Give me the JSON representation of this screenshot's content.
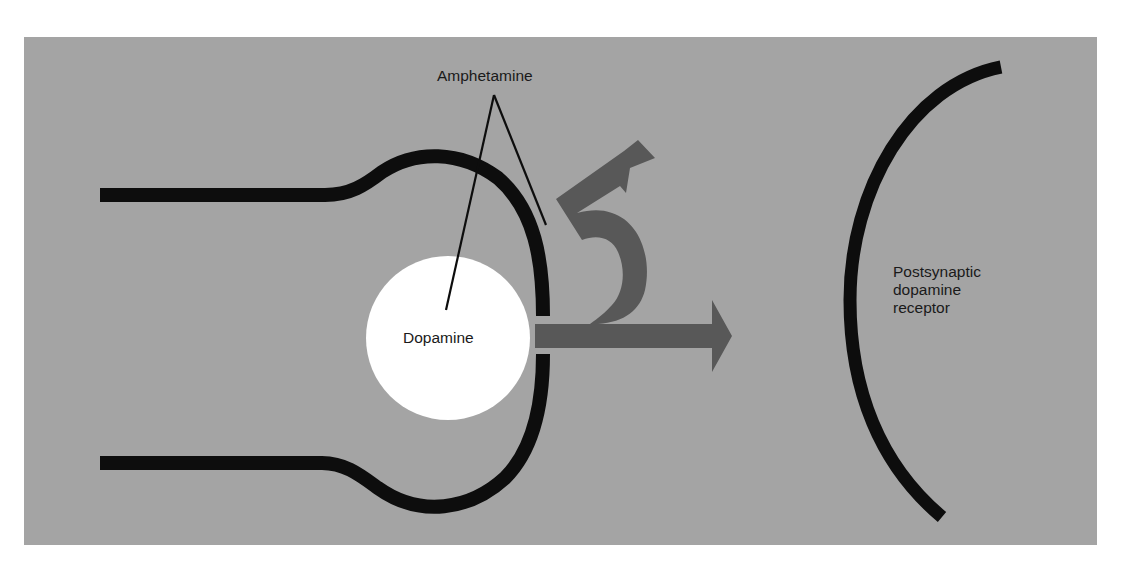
{
  "diagram": {
    "type": "synapse-schematic",
    "colors": {
      "background": "#a4a4a4",
      "membrane": "#0d0d0d",
      "arrow": "#585858",
      "vesicle": "#ffffff",
      "text": "#1a1a1a"
    },
    "labels": {
      "amphetamine": "Amphetamine",
      "dopamine": "Dopamine",
      "receptor": "Postsynaptic\ndopamine\nreceptor"
    },
    "elements": [
      {
        "id": "presynaptic-terminal",
        "description": "Bulb-shaped presynaptic terminal outline with a gap on its right side"
      },
      {
        "id": "dopamine-vesicle",
        "description": "White circle labeled Dopamine"
      },
      {
        "id": "release-arrow",
        "description": "Gray arrow pointing right out of the terminal gap toward receptor"
      },
      {
        "id": "reverse-arrow",
        "description": "Gray curved arrow looping upward and back out, pointing up-right"
      },
      {
        "id": "amphetamine-pointers",
        "description": "Two thin lines from Amphetamine label to the vesicle and to the terminal membrane"
      },
      {
        "id": "postsynaptic-receptor",
        "description": "Large black arc on the right"
      }
    ]
  }
}
